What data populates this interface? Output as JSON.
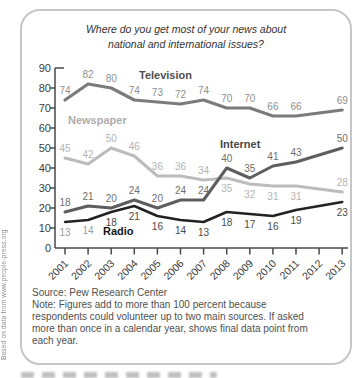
{
  "credit_sidebar": "Based on data from www.people-press.org",
  "card": {
    "title_line1": "Where do you get most of your news about",
    "title_line2": "national and international issues?",
    "source": "Source: Pew Research Center",
    "note_lines": [
      "Note: Figures add to more than 100 percent because",
      "respondents could volunteer up to two main sources.  If asked",
      "more than once in a calendar year, shows final data point from",
      "each year."
    ]
  },
  "chart_data": {
    "type": "line",
    "title": "Where do you get most of your news about national and international issues?",
    "xlabel": "",
    "ylabel": "",
    "ylim": [
      0,
      90
    ],
    "y_ticks": [
      0,
      10,
      20,
      30,
      40,
      50,
      60,
      70,
      80,
      90
    ],
    "x_tick_labels": [
      "2001",
      "2002",
      "2003",
      "2004",
      "2005",
      "2006",
      "2007",
      "2008",
      "2009",
      "2010",
      "2011",
      "2012",
      "2013"
    ],
    "point_years": [
      2001,
      2002,
      2003,
      2004,
      2005,
      2006,
      2007,
      2008,
      2009,
      2010,
      2011,
      2013
    ],
    "grid": false,
    "legend": "inline series name labels next to lines",
    "axis_color": "#4a4a4a",
    "tick_label_color": "#3c3c3c",
    "series": [
      {
        "name": "Television",
        "values": [
          74,
          82,
          80,
          74,
          73,
          72,
          74,
          70,
          70,
          66,
          66,
          69
        ],
        "line_color": "#7b7b7b",
        "value_label_color": "#8f8f8f",
        "name_label_color": "#4f4f4f",
        "label_sides": [
          "above",
          "above",
          "above",
          "above",
          "above",
          "above",
          "above",
          "above",
          "above",
          "above",
          "above",
          "above"
        ],
        "name_label_pos": [
          109,
          21
        ],
        "line_width": 3.2
      },
      {
        "name": "Newspaper",
        "values": [
          45,
          42,
          50,
          46,
          36,
          36,
          34,
          35,
          32,
          31,
          31,
          28
        ],
        "line_color": "#bcbcbc",
        "value_label_color": "#b3b3b3",
        "name_label_color": "#adadad",
        "label_sides": [
          "above",
          "above",
          "above",
          "above",
          "above",
          "above",
          "above",
          "below",
          "below",
          "below",
          "below",
          "above"
        ],
        "name_label_pos": [
          38,
          66
        ],
        "line_width": 3
      },
      {
        "name": "Internet",
        "values": [
          18,
          21,
          20,
          24,
          20,
          24,
          24,
          40,
          35,
          41,
          43,
          50
        ],
        "line_color": "#5e5e5e",
        "value_label_color": "#6f6f6f",
        "name_label_color": "#474747",
        "label_sides": [
          "above",
          "above",
          "above",
          "above",
          "above",
          "above",
          "above",
          "above",
          "above",
          "above",
          "above",
          "above"
        ],
        "name_label_pos": [
          190,
          90
        ],
        "line_width": 3
      },
      {
        "name": "Radio",
        "values": [
          13,
          14,
          18,
          21,
          16,
          14,
          13,
          18,
          17,
          16,
          19,
          23
        ],
        "line_color": "#222222",
        "value_label_color": "#4a4a4a",
        "value_label_color_overrides": {
          "0": "#9c9c9c",
          "1": "#9c9c9c"
        },
        "name_label_color": "#161616",
        "label_sides": [
          "below",
          "below",
          "below",
          "below",
          "below",
          "below",
          "below",
          "below",
          "below",
          "below",
          "below",
          "below"
        ],
        "name_label_pos": [
          73,
          177
        ],
        "line_width": 2.5
      }
    ]
  }
}
